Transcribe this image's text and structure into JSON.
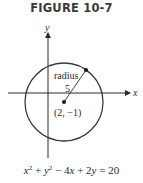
{
  "figure": {
    "title": "FIGURE 10-7",
    "axes": {
      "x_label": "x",
      "y_label": "y"
    },
    "circle": {
      "radius_label": "radius",
      "radius_value": "5",
      "center_label": "(2, −1)",
      "stroke_color": "#3a3a3a"
    },
    "equation": {
      "t1": "x",
      "e1": "2",
      "p1": " + ",
      "t2": "y",
      "e2": "2",
      "rest_a": " − 4",
      "t3": "x",
      "rest_b": " + 2",
      "t4": "y",
      "rest_c": " = 20"
    }
  }
}
